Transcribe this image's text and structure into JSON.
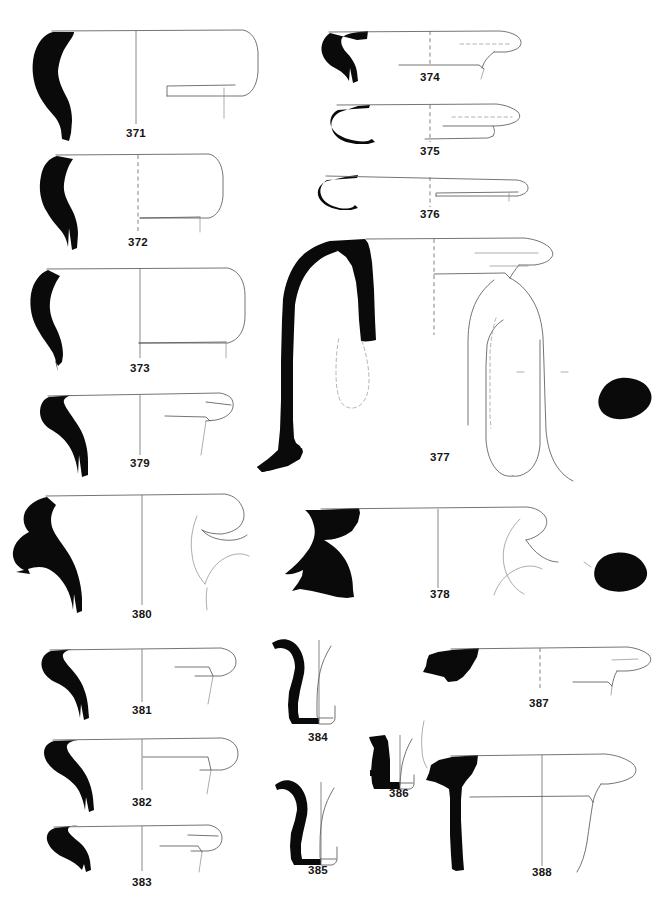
{
  "plate": {
    "kind": "archaeological-pottery-profile-plate",
    "background_color": "#ffffff",
    "ink_color": "#0a0a0a",
    "outline_color": "#5b5b5b",
    "axis_color": "#6a6a6a",
    "label_color": "#151515",
    "canvas": {
      "width": 672,
      "height": 911
    },
    "figure_count": 18
  },
  "figures": [
    {
      "id": "371",
      "label": "371",
      "label_x": 136,
      "label_y": 137,
      "column": "left",
      "row": 1,
      "type": "rim-profile"
    },
    {
      "id": "372",
      "label": "372",
      "label_x": 138,
      "label_y": 246,
      "column": "left",
      "row": 2,
      "type": "rim-profile"
    },
    {
      "id": "373",
      "label": "373",
      "label_x": 140,
      "label_y": 372,
      "column": "left",
      "row": 3,
      "type": "rim-profile"
    },
    {
      "id": "379",
      "label": "379",
      "label_x": 140,
      "label_y": 467,
      "column": "left",
      "row": 4,
      "type": "rim-profile"
    },
    {
      "id": "380",
      "label": "380",
      "label_x": 142,
      "label_y": 618,
      "column": "left",
      "row": 5,
      "type": "rim-profile-with-section"
    },
    {
      "id": "381",
      "label": "381",
      "label_x": 142,
      "label_y": 714,
      "column": "left",
      "row": 6,
      "type": "rim-profile"
    },
    {
      "id": "382",
      "label": "382",
      "label_x": 142,
      "label_y": 806,
      "column": "left",
      "row": 7,
      "type": "rim-profile"
    },
    {
      "id": "383",
      "label": "383",
      "label_x": 142,
      "label_y": 886,
      "column": "left",
      "row": 8,
      "type": "rim-profile"
    },
    {
      "id": "374",
      "label": "374",
      "label_x": 430,
      "label_y": 81,
      "column": "right",
      "row": 1,
      "type": "rim-profile"
    },
    {
      "id": "375",
      "label": "375",
      "label_x": 430,
      "label_y": 155,
      "column": "right",
      "row": 2,
      "type": "rim-profile"
    },
    {
      "id": "376",
      "label": "376",
      "label_x": 430,
      "label_y": 218,
      "column": "right",
      "row": 3,
      "type": "rim-profile"
    },
    {
      "id": "377",
      "label": "377",
      "label_x": 440,
      "label_y": 461,
      "column": "right",
      "row": 4,
      "type": "handled-jug-with-handle-section"
    },
    {
      "id": "378",
      "label": "378",
      "label_x": 440,
      "label_y": 598,
      "column": "right",
      "row": 5,
      "type": "rim-profile-with-handle-section"
    },
    {
      "id": "384",
      "label": "384",
      "label_x": 318,
      "label_y": 741,
      "column": "middle",
      "row": 6,
      "type": "base-profile"
    },
    {
      "id": "385",
      "label": "385",
      "label_x": 318,
      "label_y": 874,
      "column": "middle",
      "row": 7,
      "type": "base-profile"
    },
    {
      "id": "386",
      "label": "386",
      "label_x": 399,
      "label_y": 797,
      "column": "middle",
      "row": 7,
      "type": "base-profile"
    },
    {
      "id": "387",
      "label": "387",
      "label_x": 539,
      "label_y": 707,
      "column": "right",
      "row": 6,
      "type": "rim-profile"
    },
    {
      "id": "388",
      "label": "388",
      "label_x": 542,
      "label_y": 876,
      "column": "right",
      "row": 7,
      "type": "rim-profile"
    }
  ]
}
